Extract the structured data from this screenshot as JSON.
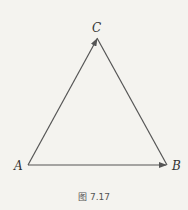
{
  "diagram": {
    "vertices": [
      {
        "label": "A",
        "x": 28,
        "y": 165
      },
      {
        "label": "B",
        "x": 167,
        "y": 165
      },
      {
        "label": "C",
        "x": 97,
        "y": 38
      }
    ],
    "edges": [
      {
        "from": "A",
        "to": "C",
        "arrow": true
      },
      {
        "from": "A",
        "to": "B",
        "arrow": true
      },
      {
        "from": "C",
        "to": "B",
        "arrow": false
      }
    ],
    "line_color": "#555555"
  },
  "labels": {
    "a": "A",
    "b": "B",
    "c": "C"
  },
  "caption": "图 7.17"
}
